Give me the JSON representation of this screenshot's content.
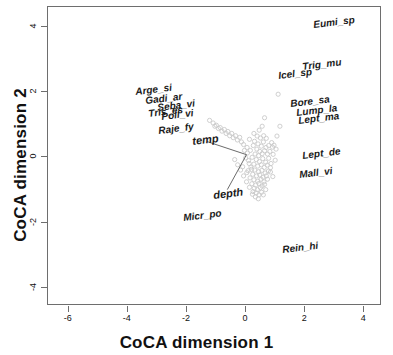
{
  "chart_data": {
    "type": "scatter",
    "title": "",
    "xlabel": "CoCA dimension 1",
    "ylabel": "CoCA dimension 2",
    "xlim": [
      -6.7,
      4.6
    ],
    "ylim": [
      -4.55,
      4.6
    ],
    "xticks": [
      -6,
      -4,
      -2,
      0,
      2,
      4
    ],
    "xticklabels": [
      "-6",
      "-4",
      "-2",
      "0",
      "2",
      "4"
    ],
    "yticks": [
      4,
      2,
      0,
      -2,
      -4
    ],
    "yticklabels": [
      "4",
      "2",
      "0",
      "-2",
      "-4"
    ],
    "grid": false,
    "legend": "none",
    "species_labels": [
      {
        "name": "Eumi_sp",
        "x": 2.35,
        "y": 4.05
      },
      {
        "name": "Trig_mu",
        "x": 1.95,
        "y": 2.75
      },
      {
        "name": "Icel_sp",
        "x": 1.15,
        "y": 2.5
      },
      {
        "name": "Arge_si",
        "x": -3.7,
        "y": 2.0
      },
      {
        "name": "Gadi_ar",
        "x": -3.35,
        "y": 1.73
      },
      {
        "name": "Seba_vi",
        "x": -2.95,
        "y": 1.52
      },
      {
        "name": "Tris_es",
        "x": -3.25,
        "y": 1.33
      },
      {
        "name": "Poll_vi",
        "x": -2.8,
        "y": 1.22
      },
      {
        "name": "Bore_sa",
        "x": 1.55,
        "y": 1.62
      },
      {
        "name": "Lump_la",
        "x": 1.75,
        "y": 1.37
      },
      {
        "name": "Lept_ma",
        "x": 1.82,
        "y": 1.12
      },
      {
        "name": "Raje_fy",
        "x": -2.9,
        "y": 0.82
      },
      {
        "name": "Lept_de",
        "x": 1.95,
        "y": 0.05
      },
      {
        "name": "Mall_vi",
        "x": 1.85,
        "y": -0.55
      },
      {
        "name": "Micr_po",
        "x": -2.05,
        "y": -1.85
      },
      {
        "name": "Rein_hi",
        "x": 1.3,
        "y": -2.85
      }
    ],
    "environment_vectors": [
      {
        "name": "temp",
        "x": -1.28,
        "y": 0.45,
        "origin_x": 0.05,
        "origin_y": 0.05
      },
      {
        "name": "depth",
        "x": -0.6,
        "y": -1.02,
        "origin_x": 0.05,
        "origin_y": 0.05
      }
    ],
    "env_label_positions": [
      {
        "name": "temp",
        "x": -1.75,
        "y": 0.48
      },
      {
        "name": "depth",
        "x": -1.05,
        "y": -1.18
      }
    ],
    "site_points_note": "light gray open circles, dense cluster near origin extending up-left along temp vector",
    "site_points": [
      [
        0.15,
        0.52
      ],
      [
        0.32,
        0.46
      ],
      [
        0.44,
        0.38
      ],
      [
        0.55,
        0.31
      ],
      [
        0.62,
        0.44
      ],
      [
        0.71,
        0.27
      ],
      [
        0.28,
        0.33
      ],
      [
        0.4,
        0.22
      ],
      [
        0.5,
        0.15
      ],
      [
        0.18,
        0.18
      ],
      [
        0.07,
        0.27
      ],
      [
        0.34,
        0.07
      ],
      [
        0.46,
        0.02
      ],
      [
        0.58,
        0.08
      ],
      [
        0.66,
        0.17
      ],
      [
        0.76,
        0.07
      ],
      [
        0.84,
        0.15
      ],
      [
        0.93,
        0.28
      ],
      [
        0.24,
        -0.03
      ],
      [
        0.38,
        -0.1
      ],
      [
        0.49,
        -0.16
      ],
      [
        0.6,
        -0.07
      ],
      [
        0.7,
        -0.18
      ],
      [
        0.8,
        -0.06
      ],
      [
        0.12,
        -0.13
      ],
      [
        0.02,
        -0.05
      ],
      [
        0.3,
        -0.24
      ],
      [
        0.43,
        -0.3
      ],
      [
        0.55,
        -0.26
      ],
      [
        0.65,
        -0.34
      ],
      [
        0.75,
        -0.27
      ],
      [
        0.86,
        -0.35
      ],
      [
        0.2,
        -0.33
      ],
      [
        0.33,
        -0.42
      ],
      [
        0.46,
        -0.47
      ],
      [
        0.57,
        -0.43
      ],
      [
        0.68,
        -0.51
      ],
      [
        0.79,
        -0.45
      ],
      [
        0.1,
        -0.44
      ],
      [
        0.26,
        -0.55
      ],
      [
        0.39,
        -0.6
      ],
      [
        0.5,
        -0.57
      ],
      [
        0.61,
        -0.64
      ],
      [
        0.72,
        -0.6
      ],
      [
        0.17,
        -0.66
      ],
      [
        0.3,
        -0.72
      ],
      [
        0.43,
        -0.76
      ],
      [
        0.54,
        -0.7
      ],
      [
        0.64,
        -0.78
      ],
      [
        0.23,
        -0.84
      ],
      [
        0.36,
        -0.88
      ],
      [
        0.47,
        -0.83
      ],
      [
        0.58,
        -0.91
      ],
      [
        0.31,
        -0.98
      ],
      [
        0.42,
        -1.02
      ],
      [
        0.52,
        -0.96
      ],
      [
        0.38,
        -1.12
      ],
      [
        0.47,
        -1.18
      ],
      [
        0.27,
        -1.08
      ],
      [
        -0.18,
        0.58
      ],
      [
        -0.32,
        0.63
      ],
      [
        -0.45,
        0.7
      ],
      [
        -0.58,
        0.76
      ],
      [
        -0.7,
        0.82
      ],
      [
        -0.84,
        0.88
      ],
      [
        -0.97,
        0.95
      ],
      [
        -1.08,
        1.02
      ],
      [
        -1.2,
        1.1
      ],
      [
        -0.26,
        0.5
      ],
      [
        -0.4,
        0.57
      ],
      [
        -0.52,
        0.63
      ],
      [
        -0.64,
        0.7
      ],
      [
        -0.78,
        0.77
      ],
      [
        -0.9,
        0.85
      ],
      [
        -1.02,
        0.92
      ],
      [
        -0.12,
        0.44
      ],
      [
        -0.05,
        0.36
      ],
      [
        0.9,
        0.42
      ],
      [
        0.98,
        0.34
      ],
      [
        1.05,
        0.22
      ],
      [
        0.95,
        0.06
      ],
      [
        1.02,
        -0.12
      ],
      [
        0.88,
        -0.22
      ],
      [
        0.8,
        0.33
      ],
      [
        0.72,
        0.55
      ],
      [
        0.63,
        0.63
      ],
      [
        0.52,
        0.56
      ],
      [
        0.41,
        0.62
      ],
      [
        0.3,
        0.7
      ],
      [
        1.12,
        1.9
      ],
      [
        0.66,
        1.18
      ],
      [
        0.58,
        0.92
      ],
      [
        0.48,
        0.8
      ],
      [
        1.18,
        0.92
      ],
      [
        1.08,
        0.62
      ],
      [
        0.86,
        -0.48
      ],
      [
        0.94,
        -0.62
      ],
      [
        0.76,
        -0.7
      ],
      [
        0.66,
        -0.86
      ],
      [
        0.56,
        -1.1
      ],
      [
        0.45,
        -1.3
      ],
      [
        0.35,
        -1.24
      ],
      [
        0.25,
        -1.16
      ],
      [
        0.15,
        -0.95
      ],
      [
        0.05,
        -0.78
      ],
      [
        -0.05,
        -0.6
      ],
      [
        -0.15,
        -0.42
      ],
      [
        -0.25,
        -0.26
      ],
      [
        -0.35,
        -0.1
      ],
      [
        0.08,
        0.1
      ],
      [
        -0.02,
        0.18
      ],
      [
        0.14,
        -0.22
      ],
      [
        0.22,
        -0.4
      ],
      [
        0.06,
        -0.5
      ],
      [
        -0.08,
        -0.32
      ],
      [
        0.7,
        -1.02
      ],
      [
        0.62,
        -1.18
      ]
    ],
    "colors": {
      "axis": "#6e6e6e",
      "text": "#111111",
      "point": "#c9c9c9",
      "vector": "#5a5a5a"
    }
  }
}
